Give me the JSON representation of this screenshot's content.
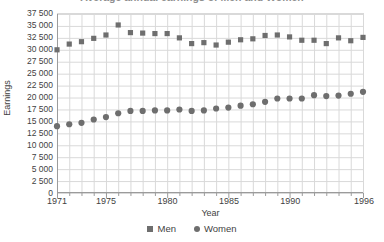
{
  "title": {
    "text": "Average annual earnings of Men and Women",
    "clipped": true
  },
  "axes": {
    "y_label": "Earnings",
    "x_label": "Year",
    "y_tick_labels": [
      "37 500",
      "35 000",
      "32 500",
      "30 000",
      "27 500",
      "25 000",
      "22 500",
      "20 000",
      "17 500",
      "15 000",
      "12 500",
      "10 000",
      "7 500",
      "5 000",
      "2 500",
      "0"
    ],
    "x_tick_labels": [
      "1971",
      "1975",
      "1980",
      "1985",
      "1990",
      "1996"
    ]
  },
  "legend": {
    "items": [
      {
        "label": "Men",
        "marker": "square-marker-icon",
        "color": "#6e6e6e"
      },
      {
        "label": "Women",
        "marker": "circle-marker-icon",
        "color": "#6e6e6e"
      }
    ]
  },
  "colors": {
    "marker": "#6e6e6e",
    "grid": "#d9d9d9",
    "axis": "#9a9a9a",
    "text": "#3f3f3f",
    "background": "#ffffff"
  },
  "chart_data": {
    "type": "scatter",
    "title": "Average annual earnings of Men and Women",
    "xlabel": "Year",
    "ylabel": "Earnings",
    "xlim": [
      1971,
      1996
    ],
    "ylim": [
      0,
      37500
    ],
    "ytick_step": 2500,
    "xtick_step": 1,
    "grid": true,
    "legend_position": "bottom-center",
    "x": [
      1971,
      1972,
      1973,
      1974,
      1975,
      1976,
      1977,
      1978,
      1979,
      1980,
      1981,
      1982,
      1983,
      1984,
      1985,
      1986,
      1987,
      1988,
      1989,
      1990,
      1991,
      1992,
      1993,
      1994,
      1995,
      1996
    ],
    "series": [
      {
        "name": "Men",
        "marker": "square",
        "color": "#6e6e6e",
        "values": [
          30000,
          31200,
          31700,
          32400,
          33100,
          35200,
          33600,
          33500,
          33400,
          33400,
          32500,
          31300,
          31500,
          31000,
          31600,
          32100,
          32300,
          33000,
          33100,
          32700,
          32000,
          32000,
          31300,
          32500,
          31900,
          32600
        ]
      },
      {
        "name": "Women",
        "marker": "circle",
        "color": "#6e6e6e",
        "values": [
          14000,
          14400,
          14700,
          15400,
          15900,
          16700,
          17200,
          17200,
          17300,
          17300,
          17500,
          17200,
          17300,
          17700,
          17900,
          18300,
          18600,
          19100,
          19800,
          19800,
          19800,
          20500,
          20300,
          20400,
          20800,
          21200
        ]
      }
    ]
  }
}
